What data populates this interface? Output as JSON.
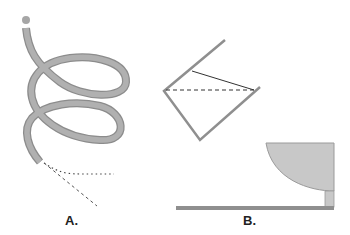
{
  "figure": {
    "panels": [
      {
        "id": "A",
        "label": "A.",
        "description": "coiled tube (spiral) with ball at top end; dotted and dashed lines emanating from bottom end"
      },
      {
        "id": "B",
        "label": "B.",
        "description": "tilted open container with solid and dashed lines; curved bowl-shaped vessel on a pedestal above a horizontal base"
      }
    ],
    "colors": {
      "tube": "#a6a6a6",
      "tube_outline": "#8c8c8c",
      "container_line": "#8f8f8f",
      "bowl_fill": "#c8c8c8",
      "base": "#8f8f8f",
      "text": "#222222"
    }
  }
}
